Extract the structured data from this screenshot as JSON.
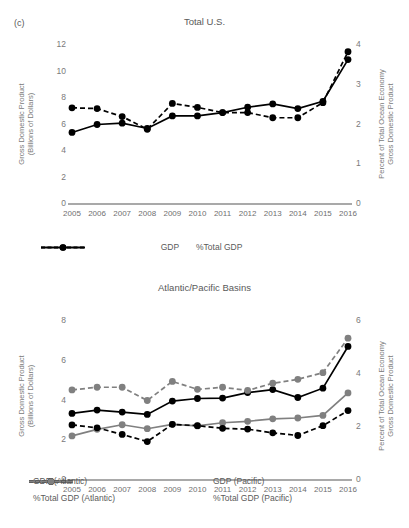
{
  "figure": {
    "panel_letter": "(c)"
  },
  "panel_a": {
    "title": "Total U.S.",
    "y_left_label_line1": "Gross Domestic Product",
    "y_left_label_line2": "(Billions of Dollars)",
    "y_right_label_line1": "Percent of Total Ocean Economy",
    "y_right_label_line2": "Gross Domestic Product",
    "legend": [
      {
        "label": "GDP",
        "style": "solid",
        "color": "#000000"
      },
      {
        "label": "%Total GDP",
        "style": "dashed",
        "color": "#000000"
      }
    ]
  },
  "panel_b": {
    "title": "Atlantic/Pacific Basins",
    "y_left_label_line1": "Gross Domestic Product",
    "y_left_label_line2": "(Billions of Dollars)",
    "y_right_label_line1": "Percent of Total Ocean Economy",
    "y_right_label_line2": "Gross Domestic Product",
    "legend": [
      {
        "label": "GDP (Atlantic)",
        "style": "solid",
        "color": "#000000"
      },
      {
        "label": "GDP (Pacific)",
        "style": "solid",
        "color": "#808080"
      },
      {
        "label": "%Total GDP (Atlantic)",
        "style": "dashed",
        "color": "#000000"
      },
      {
        "label": "%Total GDP (Pacific)",
        "style": "dashed",
        "color": "#808080"
      }
    ]
  },
  "chart_data": [
    {
      "id": "total-us",
      "type": "line",
      "title": "Total U.S.",
      "xlabel": "",
      "ylabel": "Gross Domestic Product (Billions of Dollars)",
      "y2label": "Percent of Total Ocean Economy Gross Domestic Product",
      "x": [
        "2005",
        "2006",
        "2007",
        "2008",
        "2009",
        "2010",
        "2011",
        "2012",
        "2013",
        "2014",
        "2015",
        "2016"
      ],
      "ylim": [
        0,
        12
      ],
      "yticks": [
        0,
        2,
        4,
        6,
        8,
        10,
        12
      ],
      "y2lim": [
        0,
        4
      ],
      "y2ticks": [
        0,
        1,
        2,
        3,
        4
      ],
      "grid": false,
      "legend_position": "bottom",
      "series": [
        {
          "name": "GDP",
          "axis": "left",
          "style": "solid",
          "color": "#000000",
          "marker": "circle",
          "values": [
            5.4,
            6.0,
            6.1,
            5.7,
            6.65,
            6.65,
            6.9,
            7.3,
            7.55,
            7.2,
            7.75,
            10.9
          ]
        },
        {
          "name": "%Total GDP",
          "axis": "right",
          "style": "dashed",
          "color": "#000000",
          "marker": "circle",
          "values": [
            2.42,
            2.4,
            2.2,
            1.88,
            2.53,
            2.43,
            2.3,
            2.3,
            2.17,
            2.17,
            2.55,
            3.83
          ]
        }
      ]
    },
    {
      "id": "atlantic-pacific-basins",
      "type": "line",
      "title": "Atlantic/Pacific Basins",
      "xlabel": "",
      "ylabel": "Gross Domestic Product (Billions of Dollars)",
      "y2label": "Percent of Total Ocean Economy Gross Domestic Product",
      "x": [
        "2005",
        "2006",
        "2007",
        "2008",
        "2009",
        "2010",
        "2011",
        "2012",
        "2013",
        "2014",
        "2015",
        "2016"
      ],
      "ylim": [
        0,
        8
      ],
      "yticks": [
        0,
        2,
        4,
        6,
        8
      ],
      "y2lim": [
        0,
        6
      ],
      "y2ticks": [
        0,
        2,
        4,
        6
      ],
      "grid": false,
      "legend_position": "bottom",
      "series": [
        {
          "name": "GDP (Atlantic)",
          "axis": "left",
          "style": "solid",
          "color": "#000000",
          "marker": "circle",
          "values": [
            3.35,
            3.52,
            3.42,
            3.3,
            3.97,
            4.1,
            4.12,
            4.4,
            4.55,
            4.15,
            4.62,
            6.72
          ]
        },
        {
          "name": "GDP (Pacific)",
          "axis": "left",
          "style": "solid",
          "color": "#808080",
          "marker": "circle",
          "values": [
            2.22,
            2.55,
            2.78,
            2.58,
            2.8,
            2.72,
            2.88,
            2.95,
            3.08,
            3.12,
            3.25,
            4.38
          ]
        },
        {
          "name": "%Total GDP (Atlantic)",
          "axis": "right",
          "style": "dashed",
          "color": "#000000",
          "marker": "circle",
          "values": [
            2.08,
            1.97,
            1.72,
            1.45,
            2.1,
            2.05,
            1.95,
            1.92,
            1.78,
            1.68,
            2.05,
            2.62
          ]
        },
        {
          "name": "%Total GDP (Pacific)",
          "axis": "right",
          "style": "dashed",
          "color": "#808080",
          "marker": "circle",
          "values": [
            3.4,
            3.5,
            3.5,
            3.0,
            3.72,
            3.42,
            3.5,
            3.38,
            3.65,
            3.8,
            4.05,
            5.35
          ]
        }
      ]
    }
  ]
}
